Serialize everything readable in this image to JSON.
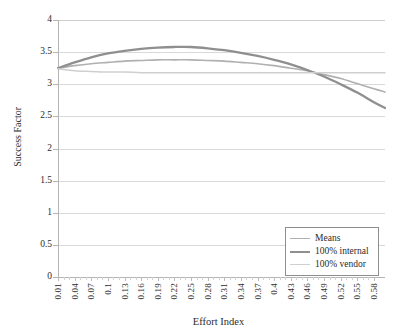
{
  "chart_data": {
    "type": "line",
    "title": "",
    "xlabel": "Effort Index",
    "ylabel": "Success Factor",
    "xlim": [
      0.01,
      0.6
    ],
    "ylim": [
      0,
      4
    ],
    "ytick_labels": [
      "4",
      "3.5",
      "3",
      "2.5",
      "2",
      "1.5",
      "1",
      "0.5",
      "0"
    ],
    "ytick_values": [
      4,
      3.5,
      3,
      2.5,
      2,
      1.5,
      1,
      0.5,
      0
    ],
    "xtick_labels": [
      "0.01",
      "0.04",
      "0.07",
      "0.1",
      "0.13",
      "0.16",
      "0.19",
      "0.22",
      "0.25",
      "0.28",
      "0.31",
      "0.34",
      "0.37",
      "0.4",
      "0.43",
      "0.46",
      "0.49",
      "0.52",
      "0.55",
      "0.58"
    ],
    "xtick_values": [
      0.01,
      0.04,
      0.07,
      0.1,
      0.13,
      0.16,
      0.19,
      0.22,
      0.25,
      0.28,
      0.31,
      0.34,
      0.37,
      0.4,
      0.43,
      0.46,
      0.49,
      0.52,
      0.55,
      0.58
    ],
    "grid": true,
    "grid_axis": "y",
    "legend_position": "bottom-right",
    "series": [
      {
        "name": "Means",
        "color": "#b0b0b0",
        "width": 1.6,
        "x": [
          0.01,
          0.04,
          0.07,
          0.1,
          0.13,
          0.16,
          0.19,
          0.22,
          0.25,
          0.28,
          0.31,
          0.34,
          0.37,
          0.4,
          0.43,
          0.46,
          0.49,
          0.52,
          0.55,
          0.58,
          0.6
        ],
        "y": [
          3.25,
          3.29,
          3.32,
          3.34,
          3.36,
          3.37,
          3.38,
          3.38,
          3.38,
          3.37,
          3.36,
          3.34,
          3.32,
          3.29,
          3.25,
          3.21,
          3.15,
          3.09,
          3.01,
          2.93,
          2.88
        ]
      },
      {
        "name": "100% internal",
        "color": "#8f8f8f",
        "width": 2.3,
        "x": [
          0.01,
          0.04,
          0.07,
          0.1,
          0.13,
          0.16,
          0.19,
          0.22,
          0.25,
          0.28,
          0.31,
          0.34,
          0.37,
          0.4,
          0.43,
          0.46,
          0.49,
          0.52,
          0.55,
          0.58,
          0.6
        ],
        "y": [
          3.25,
          3.34,
          3.42,
          3.48,
          3.52,
          3.55,
          3.57,
          3.58,
          3.58,
          3.56,
          3.53,
          3.49,
          3.44,
          3.38,
          3.31,
          3.22,
          3.12,
          3.0,
          2.87,
          2.72,
          2.63
        ]
      },
      {
        "name": "100% vendor",
        "color": "#cfcfcf",
        "width": 1.5,
        "x": [
          0.01,
          0.04,
          0.07,
          0.1,
          0.13,
          0.16,
          0.19,
          0.22,
          0.25,
          0.28,
          0.31,
          0.34,
          0.37,
          0.4,
          0.43,
          0.46,
          0.49,
          0.52,
          0.55,
          0.58,
          0.6
        ],
        "y": [
          3.24,
          3.21,
          3.2,
          3.19,
          3.19,
          3.18,
          3.18,
          3.18,
          3.18,
          3.18,
          3.18,
          3.18,
          3.18,
          3.18,
          3.18,
          3.18,
          3.18,
          3.18,
          3.18,
          3.18,
          3.18
        ]
      }
    ]
  },
  "legend": {
    "items": [
      {
        "label": "Means",
        "color": "#b0b0b0",
        "width": 1.8
      },
      {
        "label": "100% internal",
        "color": "#8f8f8f",
        "width": 2.6
      },
      {
        "label": "100% vendor",
        "color": "#cfcfcf",
        "width": 1.6
      }
    ]
  },
  "colors": {
    "gridline": "#d9d9d9",
    "axis": "#b5b5b5",
    "text": "#2b2b2b",
    "background": "#ffffff"
  }
}
